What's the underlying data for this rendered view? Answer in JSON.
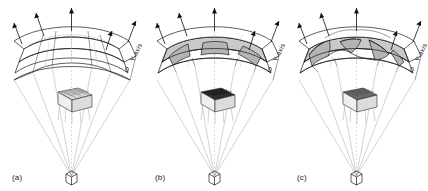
{
  "figure": {
    "background_color": "#ffffff",
    "line_color": "#1a1a1a",
    "ray_color": "#9a9a9a",
    "cut_fill_color": "#c9c9c9"
  },
  "panels": [
    {
      "id": "a",
      "caption": "(a)",
      "axis_label": "Y-axis",
      "origin_label": "0",
      "description": "smooth curved grid shell",
      "arrow_count": 5,
      "shell_layers": 2,
      "cut_regions": 0
    },
    {
      "id": "b",
      "caption": "(b)",
      "axis_label": "Y-axis",
      "origin_label": "0",
      "description": "shell with shaded rectangular cut bands",
      "arrow_count": 5,
      "shell_layers": 2,
      "cut_regions": 3
    },
    {
      "id": "c",
      "caption": "(c)",
      "axis_label": "Y-axis",
      "origin_label": "0",
      "description": "shell with irregular wavy cut surfaces",
      "arrow_count": 5,
      "shell_layers": 2,
      "cut_regions": 4
    }
  ]
}
